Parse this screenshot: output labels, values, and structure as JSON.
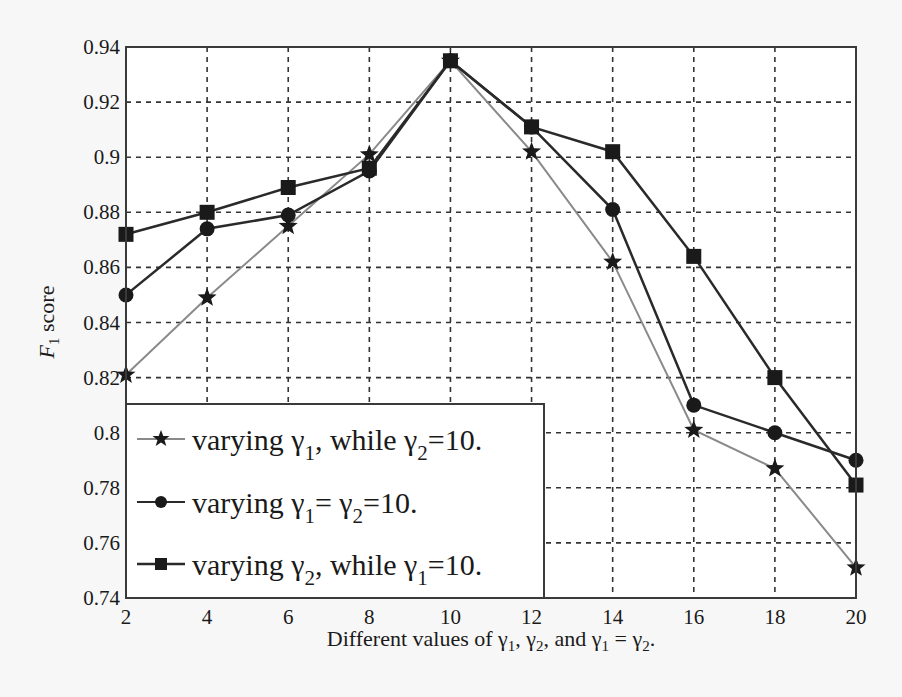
{
  "chart_data": {
    "type": "line",
    "title": "",
    "xlabel": "Different values of γ1, γ2, and γ1 = γ2.",
    "ylabel": "F1 score",
    "x": [
      2,
      4,
      6,
      8,
      10,
      12,
      14,
      16,
      18,
      20
    ],
    "xlim": [
      2,
      20
    ],
    "ylim": [
      0.74,
      0.94
    ],
    "xticks": [
      "2",
      "4",
      "6",
      "8",
      "10",
      "12",
      "14",
      "16",
      "18",
      "20"
    ],
    "yticks": [
      "0.74",
      "0.76",
      "0.78",
      "0.8",
      "0.82",
      "0.84",
      "0.86",
      "0.88",
      "0.9",
      "0.92",
      "0.94"
    ],
    "grid": true,
    "legend_position": "lower left",
    "series": [
      {
        "name": "varying γ1, while γ2=10.",
        "marker": "star",
        "color": "#8a8a8a",
        "values": [
          0.821,
          0.849,
          0.875,
          0.901,
          0.935,
          0.902,
          0.862,
          0.801,
          0.787,
          0.751
        ]
      },
      {
        "name": "varying γ1= γ2=10.",
        "marker": "circle",
        "color": "#2a2a2a",
        "values": [
          0.85,
          0.874,
          0.879,
          0.895,
          0.935,
          0.911,
          0.881,
          0.81,
          0.8,
          0.79
        ]
      },
      {
        "name": "varying γ2, while γ1=10.",
        "marker": "square",
        "color": "#2a2a2a",
        "values": [
          0.872,
          0.88,
          0.889,
          0.896,
          0.935,
          0.911,
          0.902,
          0.864,
          0.82,
          0.781
        ]
      }
    ]
  },
  "legend": {
    "items": [
      {
        "prefix": "varying γ",
        "sub1": "1",
        "mid": ", while γ",
        "sub2": "2",
        "suffix": "=10."
      },
      {
        "prefix": "varying γ",
        "sub1": "1",
        "mid": "= γ",
        "sub2": "2",
        "suffix": "=10."
      },
      {
        "prefix": "varying γ",
        "sub1": "2",
        "mid": ", while γ",
        "sub2": "1",
        "suffix": "=10."
      }
    ]
  },
  "axes": {
    "ylabel_main": "F",
    "ylabel_sub": "1",
    "ylabel_rest": " score",
    "xlabel_parts": {
      "a": "Different values of γ",
      "s1": "1",
      "b": ", γ",
      "s2": "2",
      "c": ", and γ",
      "s3": "1",
      "d": " = γ",
      "s4": "2",
      "e": "."
    }
  },
  "colors": {
    "axis": "#3a3a3a",
    "grid": "#333333",
    "background": "#f7f7f7",
    "plot_bg": "#ffffff"
  }
}
